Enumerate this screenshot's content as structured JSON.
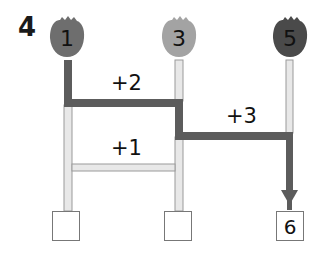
{
  "problem": {
    "number": "4"
  },
  "bulbs": [
    {
      "label": "1",
      "color": "#6e6e6e",
      "x": 66
    },
    {
      "label": "3",
      "color": "#a3a3a3",
      "x": 179
    },
    {
      "label": "5",
      "color": "#4a4a4a",
      "x": 290
    }
  ],
  "rungs": [
    {
      "label": "+2",
      "from": 0,
      "to": 1,
      "highlighted": true
    },
    {
      "label": "+3",
      "from": 1,
      "to": 2,
      "highlighted": true
    },
    {
      "label": "+1",
      "from": 0,
      "to": 1,
      "highlighted": false
    }
  ],
  "answer_boxes": [
    {
      "value": ""
    },
    {
      "value": ""
    },
    {
      "value": "6"
    }
  ],
  "colors": {
    "path_highlight": "#5a5a5a",
    "rail_light": "#e4e4e4",
    "rail_border": "#9a9a9a"
  }
}
